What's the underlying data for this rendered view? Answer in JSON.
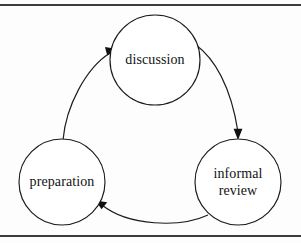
{
  "figure": {
    "background_color": "#fdfdfd",
    "stroke_color": "#1a1a1a",
    "rule_color": "#3d3d3d"
  },
  "nodes": [
    {
      "id": "discussion",
      "label": "discussion",
      "lines": [
        "discussion"
      ],
      "cx": 155,
      "cy": 60,
      "r": 45
    },
    {
      "id": "informal-review",
      "label": "informal review",
      "lines": [
        "informal",
        "review"
      ],
      "cx": 238,
      "cy": 182,
      "r": 43
    },
    {
      "id": "preparation",
      "label": "preparation",
      "lines": [
        "preparation"
      ],
      "cx": 62,
      "cy": 182,
      "r": 43
    }
  ],
  "edges": [
    {
      "id": "discussion-to-informal-review",
      "from": "discussion",
      "to": "informal review",
      "direction": "clockwise"
    },
    {
      "id": "informal-review-to-preparation",
      "from": "informal review",
      "to": "preparation",
      "direction": "clockwise"
    },
    {
      "id": "preparation-to-discussion",
      "from": "preparation",
      "to": "discussion",
      "direction": "clockwise"
    }
  ]
}
